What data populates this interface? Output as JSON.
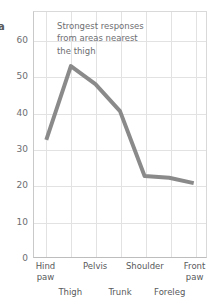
{
  "panel": {
    "letter": "a"
  },
  "annotation": {
    "line1": "Strongest responses",
    "line2": "from areas nearest",
    "line3": "the thigh"
  },
  "axes": {
    "y_ticks": [
      "0",
      "10",
      "20",
      "30",
      "40",
      "50",
      "60"
    ],
    "x_labels_top": [
      "Hind\npaw",
      "Pelvis",
      "Shoulder",
      "Front\npaw"
    ],
    "x_labels_bottom": [
      "Thigh",
      "Trunk",
      "Foreleg"
    ]
  },
  "style": {
    "line_color": "#8a8a8a",
    "grid_color": "#e2e2e2",
    "text_color": "#58595b"
  },
  "chart_data": {
    "type": "line",
    "title": "",
    "xlabel": "",
    "ylabel": "",
    "ylim": [
      0,
      68
    ],
    "yticks": [
      0,
      10,
      20,
      30,
      40,
      50,
      60
    ],
    "grid": true,
    "legend": "none",
    "categories": [
      "Hind paw",
      "Thigh",
      "Pelvis",
      "Trunk",
      "Shoulder",
      "Foreleg",
      "Front paw"
    ],
    "series": [
      {
        "name": "Response",
        "values": [
          32.5,
          53,
          48,
          40.5,
          22.5,
          22,
          20.5
        ]
      }
    ],
    "annotations": [
      {
        "text": "Strongest responses from areas nearest the thigh",
        "x": "Pelvis",
        "y": 63
      }
    ]
  }
}
